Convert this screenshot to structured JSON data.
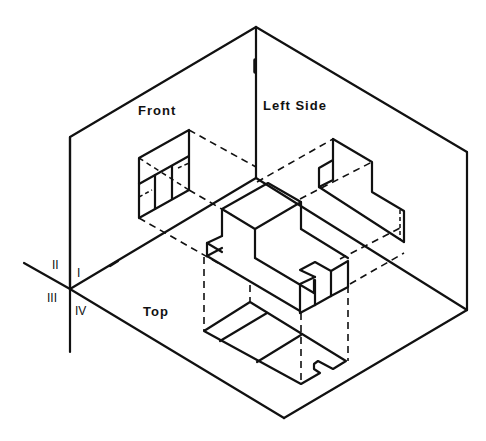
{
  "diagram": {
    "planes": {
      "front": {
        "label": "Front"
      },
      "side": {
        "label": "Left Side"
      },
      "top": {
        "label": "Top"
      }
    },
    "quadrants": {
      "q1": "I",
      "q2": "II",
      "q3": "III",
      "q4": "IV"
    },
    "colors": {
      "ink": "#111111",
      "background": "#ffffff"
    }
  }
}
